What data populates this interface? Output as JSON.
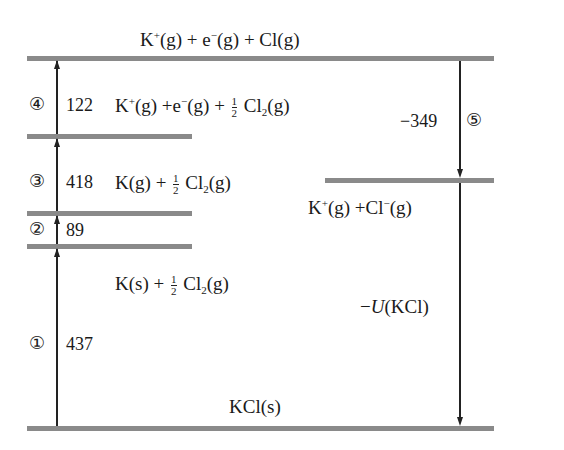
{
  "levels": {
    "top": "K+(g) + e−(g) + Cl(g)",
    "level4": "K+(g) + e−(g) + ½ Cl2(g)",
    "level3": "K(g) + ½ Cl2(g)",
    "level1": "K(s) + ½ Cl2(g)",
    "ions": "K+(g) + Cl−(g)",
    "bottom": "KCl(s)"
  },
  "labels": {
    "top_K": "K",
    "top_plus": "+",
    "top_g1": "(g) + e",
    "top_minus": "−",
    "top_g2": "(g) + Cl(g)",
    "l4_K": "K",
    "l4_plus": "+",
    "l4_mid": "(g) +e",
    "l4_minus": "−",
    "l4_g": "(g) + ",
    "l4_Cl": " Cl",
    "l4_sub": "2",
    "l4_end": "(g)",
    "l3_pre": "K(g) + ",
    "l3_Cl": " Cl",
    "l3_sub": "2",
    "l3_end": "(g)",
    "l1_pre": "K(s) + ",
    "l1_Cl": " Cl",
    "l1_sub": "2",
    "l1_end": "(g)",
    "ion_K": "K",
    "ion_plus": "+",
    "ion_mid": "(g) +Cl",
    "ion_minus": "−",
    "ion_end": "(g)",
    "bottom": "KCl(s)",
    "frac_num": "1",
    "frac_den": "2",
    "lattice_minus": "−",
    "lattice_U": "U",
    "lattice_rest": "(KCl)"
  },
  "steps": [
    {
      "marker": "①",
      "value": "437",
      "direction": "up"
    },
    {
      "marker": "②",
      "value": "89",
      "direction": "up"
    },
    {
      "marker": "③",
      "value": "418",
      "direction": "up"
    },
    {
      "marker": "④",
      "value": "122",
      "direction": "up"
    },
    {
      "marker": "⑤",
      "value": "−349",
      "direction": "down"
    }
  ],
  "colors": {
    "level_line": "#8a8a8a",
    "arrow": "#222222",
    "text": "#1a1a1a"
  }
}
